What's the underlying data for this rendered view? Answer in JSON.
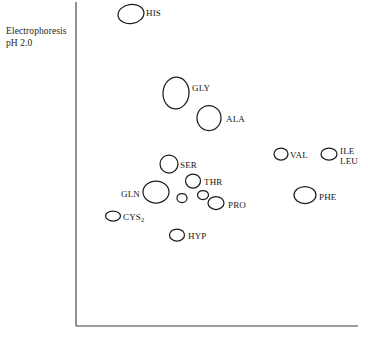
{
  "figure": {
    "axis_label": "Electrophoresis\npH 2.0",
    "axis_label_line1": "Electrophoresis",
    "axis_label_line2": "pH 2.0",
    "ink_color": "#1d1d1d",
    "background_color": "#ffffff"
  },
  "chart_data": {
    "type": "scatter",
    "title": "",
    "xlabel": "",
    "ylabel": "Electrophoresis pH 2.0",
    "grid": false,
    "legend": "none",
    "axes": {
      "origin_x": 76,
      "origin_y": 326,
      "x_axis_end": 358,
      "y_axis_top": 2
    },
    "spots": [
      {
        "name": "HIS",
        "label": "HIS",
        "cx": 131,
        "cy": 14,
        "rx": 13,
        "ry": 9.5,
        "rot": -8,
        "label_x": 146,
        "label_y": 8
      },
      {
        "name": "GLY",
        "label": "GLY",
        "cx": 176,
        "cy": 93,
        "rx": 13,
        "ry": 16,
        "rot": 4,
        "label_x": 192,
        "label_y": 83
      },
      {
        "name": "ALA",
        "label": "ALA",
        "cx": 209,
        "cy": 118,
        "rx": 12,
        "ry": 12.5,
        "rot": 0,
        "label_x": 226,
        "label_y": 114
      },
      {
        "name": "SER",
        "label": "SER",
        "cx": 169,
        "cy": 164,
        "rx": 9,
        "ry": 9,
        "rot": 0,
        "label_x": 180,
        "label_y": 160
      },
      {
        "name": "VAL",
        "label": "VAL",
        "cx": 281,
        "cy": 154,
        "rx": 7,
        "ry": 6,
        "rot": 0,
        "label_x": 290,
        "label_y": 150
      },
      {
        "name": "ILE-LEU",
        "label": "ILE\nLEU",
        "cx": 329,
        "cy": 154,
        "rx": 8,
        "ry": 6,
        "rot": 0,
        "label_x": 340,
        "label_y": 146
      },
      {
        "name": "THR",
        "label": "THR",
        "cx": 193,
        "cy": 181,
        "rx": 7.5,
        "ry": 7,
        "rot": 0,
        "label_x": 204,
        "label_y": 177
      },
      {
        "name": "GLN",
        "label": "GLN",
        "cx": 156,
        "cy": 192,
        "rx": 13,
        "ry": 11,
        "rot": 0,
        "label_x": 121,
        "label_y": 189
      },
      {
        "name": "PHE",
        "label": "PHE",
        "cx": 305,
        "cy": 195,
        "rx": 11,
        "ry": 8.5,
        "rot": 0,
        "label_x": 319,
        "label_y": 192
      },
      {
        "name": "unlabeled-small-1",
        "label": "",
        "cx": 182,
        "cy": 198,
        "rx": 5,
        "ry": 4.5,
        "rot": 0,
        "label_x": 0,
        "label_y": 0
      },
      {
        "name": "unlabeled-small-2",
        "label": "",
        "cx": 203,
        "cy": 195,
        "rx": 5.5,
        "ry": 4.5,
        "rot": 0,
        "label_x": 0,
        "label_y": 0
      },
      {
        "name": "PRO",
        "label": "PRO",
        "cx": 216,
        "cy": 203,
        "rx": 8,
        "ry": 6.5,
        "rot": 0,
        "label_x": 228,
        "label_y": 200
      },
      {
        "name": "CYS2",
        "label": "CYS",
        "sub": "2",
        "cx": 113,
        "cy": 216,
        "rx": 7.5,
        "ry": 5,
        "rot": 0,
        "label_x": 123,
        "label_y": 212
      },
      {
        "name": "HYP",
        "label": "HYP",
        "cx": 177,
        "cy": 235,
        "rx": 7.5,
        "ry": 6,
        "rot": 0,
        "label_x": 188,
        "label_y": 231
      }
    ]
  }
}
